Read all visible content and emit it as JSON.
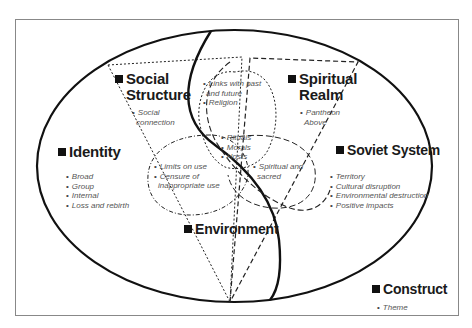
{
  "diagram": {
    "frame_color": "#888888",
    "line_color": "#111111",
    "text_color": "#1a1a1a",
    "item_color": "#555555",
    "categories": {
      "social_structure": {
        "label_line1": "Social",
        "label_line2": "Structure",
        "items": [
          "Social",
          "connection"
        ]
      },
      "spiritual_realm": {
        "label_line1": "Spiritual",
        "label_line2": "Realm",
        "items": [
          "Pantheon",
          "Above"
        ]
      },
      "identity": {
        "label": "Identity",
        "items": [
          "Broad",
          "Group",
          "Internal",
          "Loss and rebirth"
        ]
      },
      "soviet_system": {
        "label": "Soviet System",
        "items": [
          "Territory",
          "Cultural disruption",
          "Environmental destruction",
          "Positive impacts"
        ]
      },
      "environment": {
        "label": "Environment"
      },
      "construct": {
        "label": "Construct",
        "items": [
          "Theme"
        ]
      }
    },
    "overlaps": {
      "social_spiritual": [
        "Links with past",
        "and future",
        "Religion"
      ],
      "center": [
        "Rituals",
        "Morals",
        "Hosts"
      ],
      "social_environment": [
        "Limits on use",
        "Censure of",
        "inappropriate use"
      ],
      "spiritual_environment": [
        "Spiritual and",
        "sacred"
      ]
    }
  }
}
